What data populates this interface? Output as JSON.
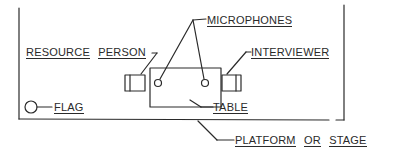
{
  "diagram": {
    "type": "floor-plan",
    "labels": {
      "microphones": "MICROPHONES",
      "resource_person_1": "RESOURCE",
      "resource_person_2": "PERSON",
      "interviewer": "INTERVIEWER",
      "flag": "FLAG",
      "table": "TABLE",
      "platform_1": "PLATFORM",
      "platform_2": "OR",
      "platform_3": "STAGE"
    },
    "colors": {
      "ink": "#2a2a2a",
      "background": "#ffffff"
    }
  }
}
